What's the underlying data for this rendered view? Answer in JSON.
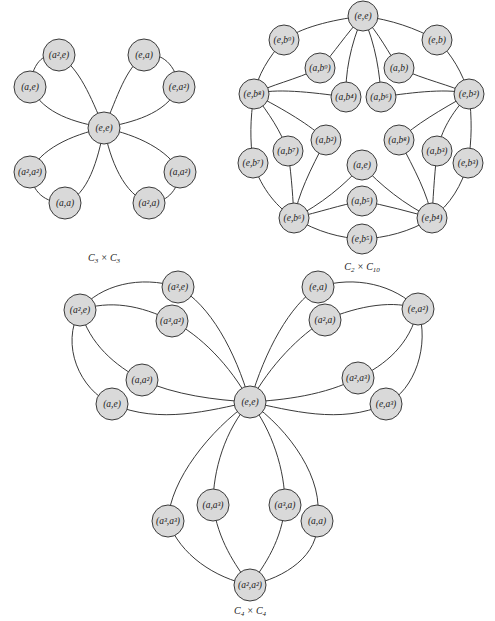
{
  "figure": {
    "graphs": [
      {
        "id": "c3xc3",
        "caption": "C3 × C3",
        "caption_display": {
          "base1": "C",
          "sub1": "3",
          "times": " × ",
          "base2": "C",
          "sub2": "3"
        },
        "center": "(e,e)",
        "nodes": [
          {
            "id": "ee",
            "label": "(e,e)",
            "x": 104,
            "y": 128
          },
          {
            "id": "a2e",
            "label": "(a²,e)",
            "x": 59,
            "y": 55
          },
          {
            "id": "ae",
            "label": "(a,e)",
            "x": 30,
            "y": 87
          },
          {
            "id": "ea",
            "label": "(e,a)",
            "x": 144,
            "y": 55
          },
          {
            "id": "ea2",
            "label": "(e,a²)",
            "x": 179,
            "y": 87
          },
          {
            "id": "a2a2",
            "label": "(a²,a²)",
            "x": 30,
            "y": 172
          },
          {
            "id": "aa",
            "label": "(a,a)",
            "x": 65,
            "y": 203
          },
          {
            "id": "a2a",
            "label": "(a²,a)",
            "x": 149,
            "y": 203
          },
          {
            "id": "aa2",
            "label": "(a,a²)",
            "x": 180,
            "y": 172
          }
        ],
        "cycles": [
          [
            "(e,e)",
            "(a,e)",
            "(a²,e)"
          ],
          [
            "(e,e)",
            "(e,a)",
            "(e,a²)"
          ],
          [
            "(e,e)",
            "(a,a)",
            "(a²,a²)"
          ],
          [
            "(e,e)",
            "(a,a²)",
            "(a²,a)"
          ]
        ]
      },
      {
        "id": "c2xc10",
        "caption": "C2 × C10",
        "caption_display": {
          "base1": "C",
          "sub1": "2",
          "times": " × ",
          "base2": "C",
          "sub2": "10"
        },
        "center": "(e,e)",
        "nodes": [
          {
            "id": "ee",
            "label": "(e,e)",
            "x": 363,
            "y": 16
          },
          {
            "id": "eb9",
            "label": "(e,b⁹)",
            "x": 284,
            "y": 40
          },
          {
            "id": "eb",
            "label": "(e,b)",
            "x": 437,
            "y": 40
          },
          {
            "id": "ab9",
            "label": "(a,b⁹)",
            "x": 320,
            "y": 68
          },
          {
            "id": "ab",
            "label": "(a,b)",
            "x": 399,
            "y": 68
          },
          {
            "id": "eb8",
            "label": "(e,b⁸)",
            "x": 254,
            "y": 94
          },
          {
            "id": "ab4",
            "label": "(a,b⁴)",
            "x": 346,
            "y": 97
          },
          {
            "id": "ab6",
            "label": "(a,b⁶)",
            "x": 381,
            "y": 97
          },
          {
            "id": "eb2",
            "label": "(e,b²)",
            "x": 469,
            "y": 94
          },
          {
            "id": "ab7",
            "label": "(a,b⁷)",
            "x": 288,
            "y": 151
          },
          {
            "id": "ab2",
            "label": "(a,b²)",
            "x": 326,
            "y": 140
          },
          {
            "id": "ab8",
            "label": "(a,b⁸)",
            "x": 399,
            "y": 140
          },
          {
            "id": "ab3",
            "label": "(a,b³)",
            "x": 437,
            "y": 151
          },
          {
            "id": "eb7",
            "label": "(e,b⁷)",
            "x": 253,
            "y": 163
          },
          {
            "id": "eb3",
            "label": "(e,b³)",
            "x": 468,
            "y": 163
          },
          {
            "id": "ae",
            "label": "(a,e)",
            "x": 362,
            "y": 165
          },
          {
            "id": "ab5",
            "label": "(a,b⁵)",
            "x": 362,
            "y": 201
          },
          {
            "id": "eb6",
            "label": "(e,b⁶)",
            "x": 294,
            "y": 218
          },
          {
            "id": "eb4",
            "label": "(e,b⁴)",
            "x": 432,
            "y": 218
          },
          {
            "id": "eb5",
            "label": "(e,b⁵)",
            "x": 362,
            "y": 239
          }
        ]
      },
      {
        "id": "c4xc4",
        "caption": "C4 × C4",
        "caption_display": {
          "base1": "C",
          "sub1": "4",
          "times": " × ",
          "base2": "C",
          "sub2": "4"
        },
        "center": "(e,e)",
        "nodes": [
          {
            "id": "ee",
            "label": "(e,e)",
            "x": 250,
            "y": 402
          },
          {
            "id": "a2e",
            "label": "(a²,e)",
            "x": 80,
            "y": 310
          },
          {
            "id": "a3e",
            "label": "(a³,e)",
            "x": 178,
            "y": 287
          },
          {
            "id": "a3a2",
            "label": "(a³,a²)",
            "x": 172,
            "y": 321
          },
          {
            "id": "aa2",
            "label": "(a,a²)",
            "x": 142,
            "y": 380
          },
          {
            "id": "ae",
            "label": "(a,e)",
            "x": 112,
            "y": 404
          },
          {
            "id": "ea",
            "label": "(e,a)",
            "x": 318,
            "y": 287
          },
          {
            "id": "a2a",
            "label": "(a²,a)",
            "x": 325,
            "y": 320
          },
          {
            "id": "ea2",
            "label": "(e,a²)",
            "x": 418,
            "y": 309
          },
          {
            "id": "a2a3",
            "label": "(a²,a³)",
            "x": 358,
            "y": 378
          },
          {
            "id": "ea3",
            "label": "(e,a³)",
            "x": 386,
            "y": 404
          },
          {
            "id": "a3a3",
            "label": "(a³,a³)",
            "x": 168,
            "y": 521
          },
          {
            "id": "aa3",
            "label": "(a,a³)",
            "x": 213,
            "y": 505
          },
          {
            "id": "a3a",
            "label": "(a³,a)",
            "x": 285,
            "y": 505
          },
          {
            "id": "aa",
            "label": "(a,a)",
            "x": 317,
            "y": 521
          },
          {
            "id": "a2a2",
            "label": "(a²,a²)",
            "x": 250,
            "y": 585
          }
        ]
      }
    ]
  },
  "style": {
    "node_fill": "#d9d9d9",
    "stroke": "#3a3a3a",
    "background": "#ffffff"
  }
}
